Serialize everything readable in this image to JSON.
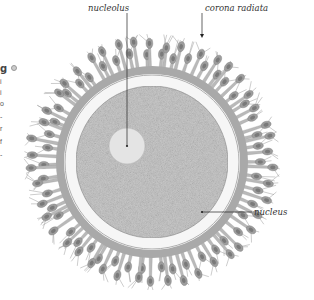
{
  "figure": {
    "type": "illustration",
    "labels": {
      "nucleolus": "nucleolus",
      "corona_radiata": "corona radiata",
      "nucleus": "nucleus"
    }
  },
  "edge_fragment": {
    "heading_char": "g",
    "line_chars": [
      "i",
      "i",
      "o",
      "-",
      "r",
      "f",
      "-",
      "-",
      "t",
      "i"
    ]
  },
  "colors": {
    "background": "#ffffff",
    "corona_fill": "#b9b9b9",
    "corona_base": "#a9a9a9",
    "cell_body": "#9d9d9d",
    "cell_nucleus": "#7a7a7a",
    "zona": "#f6f6f6",
    "zona_edge": "#9a9a9a",
    "cytoplasm": "#c9c9c9",
    "nucleolus": "#e4e4e4",
    "leader": "#222222"
  },
  "geometry": {
    "center": [
      152,
      162
    ],
    "corona_outer_radius": 128,
    "corona_base_radius": 95,
    "zona_radius": 87,
    "cytoplasm_radius": 76,
    "nucleolus_center": [
      127,
      146
    ],
    "nucleolus_radius": 18,
    "cell_count": 46
  },
  "leaders": {
    "nucleolus": {
      "x1": 127,
      "y1": 13,
      "x2": 127,
      "y2": 146,
      "label_x": 88,
      "label_y": 11
    },
    "corona_radiata": {
      "x1": 202,
      "y1": 13,
      "x2": 202,
      "y2": 38,
      "label_x": 205,
      "label_y": 11
    },
    "nucleus": {
      "x1": 202,
      "y1": 212,
      "x2": 252,
      "y2": 212,
      "label_x": 254,
      "label_y": 215
    }
  }
}
